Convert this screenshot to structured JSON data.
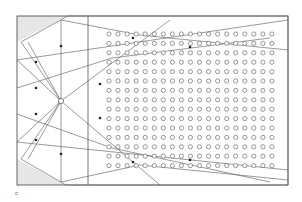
{
  "figure": {
    "panel_label": "c",
    "colors": {
      "line": "#6f6f6f",
      "frame": "#555555",
      "shade": "#e6e6e6",
      "dot": "#555555",
      "marker": "#222222"
    },
    "frame": {
      "x1": 17,
      "y1": 16,
      "x2": 288,
      "y2": 185
    },
    "divider_x": 88,
    "emitter": {
      "cx": 61,
      "cy": 101,
      "r": 2.6
    },
    "shaded_regions": [
      {
        "name": "top-left-corner",
        "points": "17,16 68,16 17,42"
      },
      {
        "name": "bottom-left-corner",
        "points": "17,159 17,185 66,185"
      }
    ],
    "dot_grid": {
      "x0": 109,
      "y0": 34,
      "dx": 9.05,
      "dy": 9.4,
      "cols": 19,
      "rows": 15,
      "r": 2.1
    },
    "rays": [
      {
        "points": "61,101 61,20"
      },
      {
        "points": "61,101 61,182"
      },
      {
        "points": "61,101 21,42 68,16"
      },
      {
        "points": "61,101 21,159 66,185"
      },
      {
        "points": "61,101 17,60"
      },
      {
        "points": "61,101 17,142"
      },
      {
        "points": "17,60 288,20"
      },
      {
        "points": "17,142 288,170"
      },
      {
        "points": "61,101 28,42"
      },
      {
        "points": "61,101 28,159"
      },
      {
        "points": "61,20 140,35 288,50"
      },
      {
        "points": "61,182 140,165 288,180"
      },
      {
        "points": "61,101 170,20"
      },
      {
        "points": "61,101 160,185"
      },
      {
        "points": "68,16 288,16 288,185 66,185"
      },
      {
        "points": "17,88 112,58 270,38"
      },
      {
        "points": "17,114 112,148 270,182"
      }
    ],
    "markers": [
      {
        "x": 61,
        "y": 46
      },
      {
        "x": 61,
        "y": 154
      },
      {
        "x": 36,
        "y": 62
      },
      {
        "x": 36,
        "y": 140
      },
      {
        "x": 36,
        "y": 88
      },
      {
        "x": 36,
        "y": 114
      },
      {
        "x": 133,
        "y": 38
      },
      {
        "x": 190,
        "y": 47
      },
      {
        "x": 100,
        "y": 84
      },
      {
        "x": 100,
        "y": 118
      },
      {
        "x": 133,
        "y": 162
      },
      {
        "x": 190,
        "y": 160
      }
    ]
  }
}
